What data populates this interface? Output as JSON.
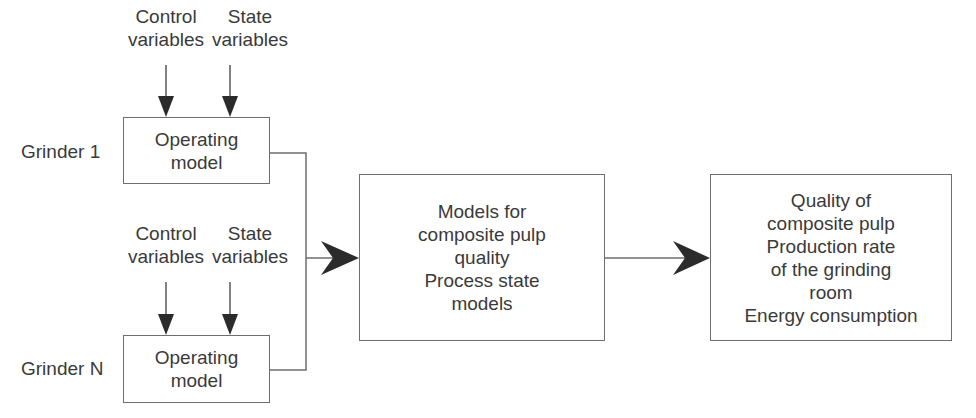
{
  "diagram": {
    "grinder1": {
      "label": "Grinder 1",
      "inputs": {
        "control": {
          "line1": "Control",
          "line2": "variables"
        },
        "state": {
          "line1": "State",
          "line2": "variables"
        }
      },
      "box": {
        "line1": "Operating",
        "line2": "model"
      }
    },
    "grinderN": {
      "label": "Grinder N",
      "inputs": {
        "control": {
          "line1": "Control",
          "line2": "variables"
        },
        "state": {
          "line1": "State",
          "line2": "variables"
        }
      },
      "box": {
        "line1": "Operating",
        "line2": "model"
      }
    },
    "middle_box": {
      "lines": [
        "Models for",
        "composite pulp",
        "quality",
        "Process state",
        "models"
      ]
    },
    "output_box": {
      "lines": [
        "Quality of",
        "composite pulp",
        "Production rate",
        "of the grinding",
        "room",
        "Energy consumption"
      ]
    },
    "colors": {
      "line": "#6e6e6e",
      "arrow": "#2b2b2b",
      "text": "#3a3a3a"
    }
  }
}
